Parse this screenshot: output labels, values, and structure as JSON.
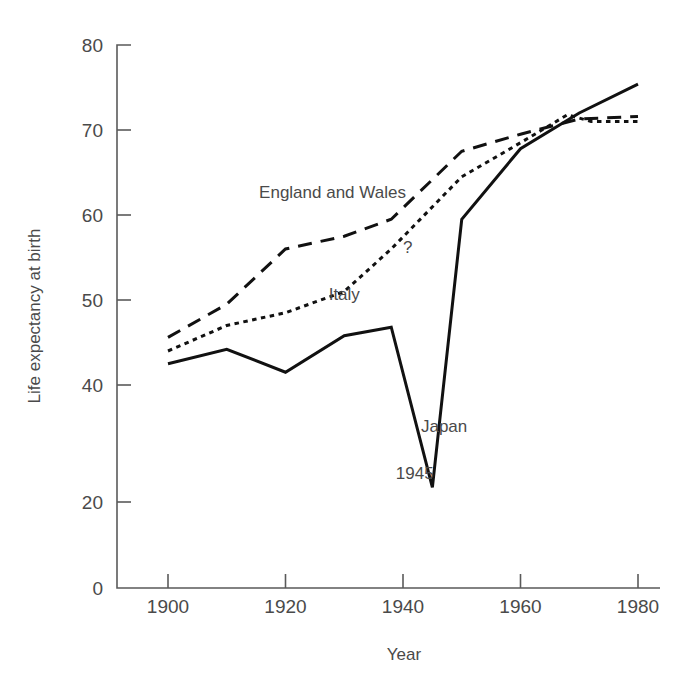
{
  "chart_data": {
    "type": "line",
    "title": "",
    "xlabel": "Year",
    "ylabel": "Life expectancy at birth",
    "xlim": [
      1895,
      1980
    ],
    "ylim": [
      0,
      80
    ],
    "grid": false,
    "legend_position": "inline-annotations",
    "x_ticks": [
      "1900",
      "1920",
      "1940",
      "1960",
      "1980"
    ],
    "x_tick_values": [
      1900,
      1920,
      1940,
      1960,
      1980
    ],
    "y_ticks": [
      "0",
      "20",
      "40",
      "50",
      "60",
      "70",
      "80"
    ],
    "y_tick_values": [
      0,
      20,
      40,
      50,
      60,
      70,
      80
    ],
    "y_axis_note": "Axis is broken/compressed between 0 and 40",
    "series": [
      {
        "name": "England and Wales",
        "style": "dashed",
        "label": "England and Wales",
        "x": [
          1900,
          1910,
          1920,
          1930,
          1938,
          1950,
          1960,
          1970,
          1980
        ],
        "values": [
          45.6,
          49.5,
          56.0,
          57.5,
          59.5,
          67.5,
          69.5,
          71.3,
          71.6
        ]
      },
      {
        "name": "Italy",
        "style": "dotted",
        "label": "Italy",
        "end_marker_label": "?",
        "x": [
          1900,
          1910,
          1920,
          1930,
          1938,
          1950,
          1960,
          1968,
          1972,
          1980
        ],
        "values": [
          44.0,
          47.0,
          48.5,
          51.0,
          56.0,
          64.5,
          68.5,
          71.8,
          71.0,
          71.0
        ]
      },
      {
        "name": "Japan",
        "style": "solid",
        "label": "Japan",
        "event_label": "1945",
        "x": [
          1900,
          1910,
          1920,
          1930,
          1938,
          1945,
          1950,
          1960,
          1970,
          1980
        ],
        "values": [
          42.5,
          44.2,
          41.5,
          45.8,
          46.8,
          22.5,
          59.5,
          67.8,
          72.0,
          75.4
        ]
      }
    ],
    "annotations": [
      {
        "text": "England and Wales",
        "series": "England and Wales",
        "x": 1928,
        "y": 62
      },
      {
        "text": "Italy",
        "series": "Italy",
        "x": 1930,
        "y": 50
      },
      {
        "text": "?",
        "series": "Italy",
        "x": 1940,
        "y": 55.5
      },
      {
        "text": "Japan",
        "series": "Japan",
        "x": 1947,
        "y": 32
      },
      {
        "text": "1945",
        "series": "Japan",
        "x": 1942,
        "y": 24
      }
    ]
  },
  "colors": {
    "background": "#ffffff",
    "axis": "#5a5a5a",
    "line": "#111111",
    "text": "#4a4a4a"
  }
}
